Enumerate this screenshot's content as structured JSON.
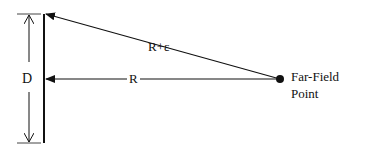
{
  "diagram": {
    "type": "far-field geometry",
    "labels": {
      "aperture_dimension": "D",
      "direct_distance": "R",
      "edge_distance": "R+ε",
      "point_line1": "Far-Field",
      "point_line2": "Point"
    },
    "elements": [
      {
        "id": "aperture",
        "kind": "vertical line",
        "description": "Antenna aperture of size D"
      },
      {
        "id": "dimension-arrow",
        "kind": "double-headed arrow",
        "label": "D"
      },
      {
        "id": "direct-ray",
        "kind": "arrow",
        "from": "Far-Field Point",
        "to": "aperture center",
        "label": "R"
      },
      {
        "id": "edge-ray",
        "kind": "arrow",
        "from": "Far-Field Point",
        "to": "aperture top edge",
        "label": "R+ε"
      },
      {
        "id": "far-field-point",
        "kind": "filled dot",
        "label": "Far-Field Point"
      }
    ],
    "colors": {
      "stroke": "#111111",
      "background": "#ffffff"
    }
  }
}
